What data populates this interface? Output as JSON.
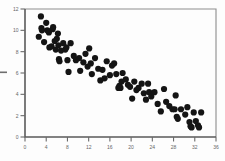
{
  "chart_data": {
    "type": "scatter",
    "title": "",
    "subtitle": "",
    "xlabel": "",
    "ylabel": "",
    "xlim": [
      0,
      36
    ],
    "ylim": [
      0,
      12
    ],
    "grid": false,
    "legend": null,
    "x_ticks": [
      0,
      4,
      8,
      12,
      16,
      20,
      24,
      28,
      32,
      36
    ],
    "y_ticks": [
      0,
      2,
      4,
      6,
      8,
      10,
      12
    ],
    "x_tick_labels": [
      "0",
      "4",
      "8",
      "12",
      "16",
      "20",
      "24",
      "28",
      "32",
      "36"
    ],
    "y_tick_labels": [
      "0",
      "2",
      "4",
      "6",
      "8",
      "10",
      "12"
    ],
    "marker": "filled-circle",
    "marker_color": "#141414",
    "marker_size": 3.1,
    "point_count": 86,
    "trend": "negative-linear",
    "points": [
      [
        2.6,
        9.4
      ],
      [
        3.0,
        11.3
      ],
      [
        3.1,
        10.2
      ],
      [
        3.2,
        10.0
      ],
      [
        3.6,
        8.9
      ],
      [
        4.0,
        10.7
      ],
      [
        4.2,
        10.0
      ],
      [
        4.5,
        9.8
      ],
      [
        4.6,
        8.4
      ],
      [
        5.0,
        8.5
      ],
      [
        5.2,
        10.1
      ],
      [
        5.3,
        10.3
      ],
      [
        5.6,
        9.0
      ],
      [
        5.8,
        8.2
      ],
      [
        6.0,
        9.2
      ],
      [
        6.2,
        9.7
      ],
      [
        6.3,
        8.6
      ],
      [
        6.4,
        7.3
      ],
      [
        6.5,
        7.1
      ],
      [
        6.8,
        8.1
      ],
      [
        7.2,
        8.8
      ],
      [
        7.6,
        8.2
      ],
      [
        7.8,
        8.4
      ],
      [
        8.0,
        7.2
      ],
      [
        8.2,
        6.1
      ],
      [
        8.6,
        8.8
      ],
      [
        9.2,
        7.6
      ],
      [
        9.6,
        7.2
      ],
      [
        10.2,
        7.4
      ],
      [
        10.4,
        6.2
      ],
      [
        11.0,
        7.0
      ],
      [
        11.4,
        7.8
      ],
      [
        11.8,
        6.6
      ],
      [
        12.1,
        8.3
      ],
      [
        12.4,
        6.9
      ],
      [
        12.6,
        5.9
      ],
      [
        13.2,
        7.4
      ],
      [
        13.8,
        6.4
      ],
      [
        14.2,
        5.3
      ],
      [
        14.6,
        6.3
      ],
      [
        15.0,
        5.5
      ],
      [
        15.4,
        7.1
      ],
      [
        16.0,
        5.8
      ],
      [
        16.4,
        6.7
      ],
      [
        16.8,
        6.9
      ],
      [
        17.2,
        5.9
      ],
      [
        17.6,
        4.6
      ],
      [
        17.8,
        4.8
      ],
      [
        18.0,
        4.6
      ],
      [
        18.2,
        5.2
      ],
      [
        18.4,
        6.0
      ],
      [
        19.0,
        5.4
      ],
      [
        19.4,
        4.9
      ],
      [
        19.8,
        4.7
      ],
      [
        20.2,
        3.6
      ],
      [
        20.6,
        5.2
      ],
      [
        21.0,
        4.4
      ],
      [
        21.4,
        4.6
      ],
      [
        22.0,
        5.0
      ],
      [
        22.4,
        4.1
      ],
      [
        22.8,
        3.5
      ],
      [
        23.2,
        5.0
      ],
      [
        23.4,
        4.2
      ],
      [
        23.8,
        3.8
      ],
      [
        24.4,
        4.2
      ],
      [
        25.0,
        3.1
      ],
      [
        25.6,
        2.4
      ],
      [
        26.2,
        4.5
      ],
      [
        26.6,
        3.3
      ],
      [
        27.2,
        2.9
      ],
      [
        27.8,
        2.6
      ],
      [
        28.2,
        2.6
      ],
      [
        28.4,
        3.9
      ],
      [
        28.6,
        1.9
      ],
      [
        28.8,
        1.7
      ],
      [
        29.4,
        2.6
      ],
      [
        30.2,
        2.1
      ],
      [
        30.6,
        2.8
      ],
      [
        31.0,
        1.4
      ],
      [
        31.2,
        1.0
      ],
      [
        31.4,
        0.9
      ],
      [
        31.8,
        2.3
      ],
      [
        32.2,
        1.5
      ],
      [
        32.6,
        1.1
      ],
      [
        32.8,
        0.9
      ],
      [
        33.2,
        2.3
      ]
    ]
  },
  "figure": {
    "background_color": "#fdfdfd",
    "axis_color": "#5a5a5a",
    "frame_color": "#8d8d8d",
    "tick_label_color": "#666666"
  },
  "artifacts": {
    "left_edge_mark": "scan-artifact-dash"
  }
}
